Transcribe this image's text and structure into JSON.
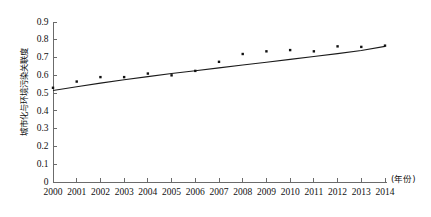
{
  "chart_data": {
    "type": "scatter",
    "title": "",
    "subtitle": "",
    "xlabel": "(年份)",
    "ylabel": "城市化与环境污染关联度",
    "x": [
      2000,
      2001,
      2002,
      2003,
      2004,
      2005,
      2006,
      2007,
      2008,
      2009,
      2010,
      2011,
      2012,
      2013,
      2014
    ],
    "categories": [
      "2000",
      "2001",
      "2002",
      "2003",
      "2004",
      "2005",
      "2006",
      "2007",
      "2008",
      "2009",
      "2010",
      "2011",
      "2012",
      "2013",
      "2014"
    ],
    "series": [
      {
        "name": "城市化与环境污染关联度",
        "type": "scatter",
        "marker": "square",
        "color": "#111111",
        "values": [
          0.53,
          0.565,
          0.59,
          0.59,
          0.61,
          0.6,
          0.625,
          0.676,
          0.72,
          0.735,
          0.742,
          0.735,
          0.763,
          0.76,
          0.767
        ]
      },
      {
        "name": "拟合趋势线",
        "type": "line",
        "color": "#1a1a1a",
        "values": [
          0.515,
          0.536,
          0.556,
          0.575,
          0.593,
          0.61,
          0.626,
          0.642,
          0.658,
          0.674,
          0.69,
          0.706,
          0.722,
          0.74,
          0.763
        ]
      }
    ],
    "xlim": [
      2000,
      2014
    ],
    "ylim": [
      0,
      0.9
    ],
    "ytick_values": [
      0,
      0.1,
      0.2,
      0.3,
      0.4,
      0.5,
      0.6,
      0.7,
      0.8,
      0.9
    ],
    "ytick_labels": [
      "0",
      "0.1",
      "0.2",
      "0.3",
      "0.4",
      "0.5",
      "0.6",
      "0.7",
      "0.8",
      "0.9"
    ],
    "xtick_labels": [
      "2000",
      "2001",
      "2002",
      "2003",
      "2004",
      "2005",
      "2006",
      "2007",
      "2008",
      "2009",
      "2010",
      "2011",
      "2012",
      "2013",
      "2014"
    ],
    "grid": false,
    "legend": null,
    "legend_position": "none",
    "annotations": []
  },
  "axis": {
    "x_unit_label": "(年份)",
    "y_axis_title": "城市化与环境污染关联度",
    "axis_color": "#6b6b6b",
    "text_color": "#111111"
  },
  "background": {
    "color": "#ffffff"
  }
}
